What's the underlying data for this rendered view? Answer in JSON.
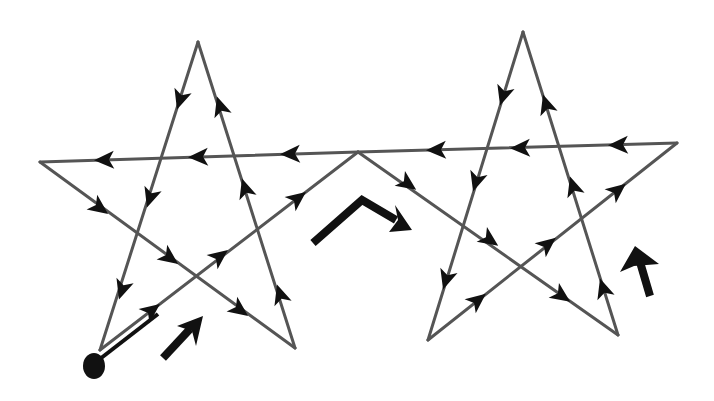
{
  "diagram": {
    "title": "Continuous path tracing two five-pointed stars",
    "colors": {
      "background": "#ffffff",
      "stroke": "#555555",
      "arrow": "#111111"
    },
    "start_point": {
      "x": 94,
      "y": 366,
      "label": "start-dot"
    },
    "left_star": {
      "vertices": {
        "bottom_left": [
          100,
          350
        ],
        "top": [
          198,
          42
        ],
        "bottom_right": [
          295,
          348
        ],
        "left": [
          40,
          162
        ],
        "join": [
          358,
          152
        ]
      }
    },
    "right_star": {
      "vertices": {
        "join": [
          358,
          152
        ],
        "bottom_right": [
          618,
          335
        ],
        "top": [
          523,
          32
        ],
        "bottom_left": [
          428,
          340
        ],
        "right": [
          677,
          143
        ]
      }
    },
    "direction_arrows": [
      {
        "name": "left-star-direction-arrow",
        "from": [
          163,
          358
        ],
        "to": [
          200,
          318
        ]
      },
      {
        "name": "bridge-direction-arrow",
        "via": [
          [
            313,
            243
          ],
          [
            362,
            200
          ],
          [
            410,
            228
          ]
        ]
      },
      {
        "name": "right-star-direction-arrow",
        "from": [
          650,
          296
        ],
        "to": [
          637,
          250
        ]
      }
    ]
  }
}
